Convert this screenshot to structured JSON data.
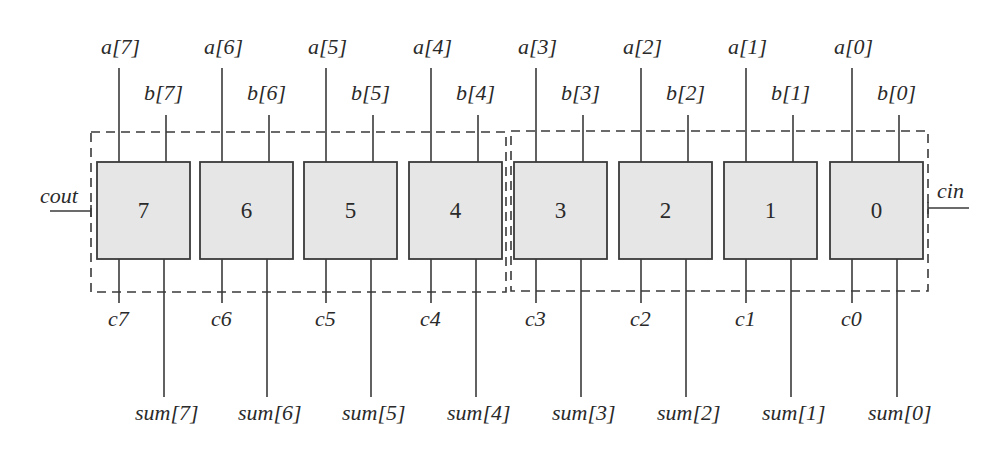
{
  "diagram": {
    "title": "",
    "type": "8-bit ripple-carry adder (two 4-bit groups)",
    "carry_in_label": "cin",
    "carry_out_label": "cout",
    "blocks": [
      {
        "id": "7",
        "label": "7",
        "a": "a[7]",
        "b": "b[7]",
        "c": "c7",
        "sum": "sum[7]",
        "x": 97
      },
      {
        "id": "6",
        "label": "6",
        "a": "a[6]",
        "b": "b[6]",
        "c": "c6",
        "sum": "sum[6]",
        "x": 200
      },
      {
        "id": "5",
        "label": "5",
        "a": "a[5]",
        "b": "b[5]",
        "c": "c5",
        "sum": "sum[5]",
        "x": 304
      },
      {
        "id": "4",
        "label": "4",
        "a": "a[4]",
        "b": "b[4]",
        "c": "c4",
        "sum": "sum[4]",
        "x": 409
      },
      {
        "id": "3",
        "label": "3",
        "a": "a[3]",
        "b": "b[3]",
        "c": "c3",
        "sum": "sum[3]",
        "x": 514
      },
      {
        "id": "2",
        "label": "2",
        "a": "a[2]",
        "b": "b[2]",
        "c": "c2",
        "sum": "sum[2]",
        "x": 619
      },
      {
        "id": "1",
        "label": "1",
        "a": "a[1]",
        "b": "b[1]",
        "c": "c1",
        "sum": "sum[1]",
        "x": 724
      },
      {
        "id": "0",
        "label": "0",
        "a": "a[0]",
        "b": "b[0]",
        "c": "c0",
        "sum": "sum[0]",
        "x": 830
      }
    ],
    "groups": [
      {
        "name": "upper-nibble",
        "blocks": [
          "7",
          "6",
          "5",
          "4"
        ]
      },
      {
        "name": "lower-nibble",
        "blocks": [
          "3",
          "2",
          "1",
          "0"
        ]
      }
    ],
    "colors": {
      "block_fill": "#e6e6e6",
      "stroke": "#3a3a3a",
      "background": "#ffffff"
    }
  }
}
